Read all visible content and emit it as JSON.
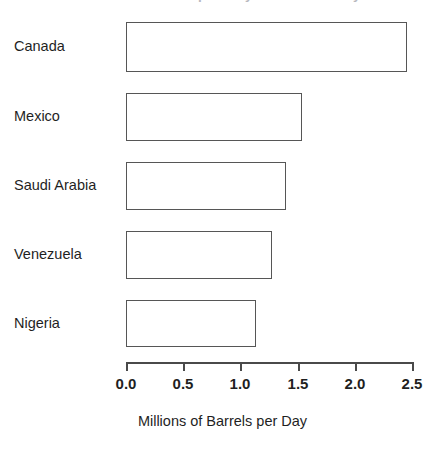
{
  "chart_data": {
    "type": "bar",
    "orientation": "horizontal",
    "title": "U.S. Crude Oil Imports by Source Country",
    "title_clipped": true,
    "xlabel": "Millions of Barrels per Day",
    "ylabel": "",
    "categories": [
      "Canada",
      "Mexico",
      "Saudi Arabia",
      "Venezuela",
      "Nigeria"
    ],
    "values": [
      2.46,
      1.54,
      1.4,
      1.28,
      1.14
    ],
    "xlim": [
      0.0,
      2.5
    ],
    "xticks": [
      0.0,
      0.5,
      1.0,
      1.5,
      2.0,
      2.5
    ],
    "xtick_labels": [
      "0.0",
      "0.5",
      "1.0",
      "1.5",
      "2.0",
      "2.5"
    ],
    "grid": false,
    "legend": null,
    "bar_fill": "#ffffff",
    "bar_stroke": "#565656",
    "axis_color": "#4a4a4a",
    "text_color": "#1f1f1f"
  }
}
